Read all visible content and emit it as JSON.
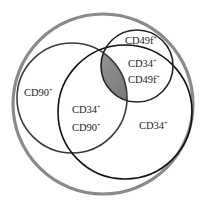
{
  "diagram": {
    "type": "venn",
    "sets": [
      {
        "name": "outer",
        "label": "",
        "color": "#8a8a8a"
      },
      {
        "name": "CD90",
        "label": "CD90",
        "sup": "+",
        "color": "#3a3a3a"
      },
      {
        "name": "CD34",
        "label": "CD34",
        "sup": "+",
        "color": "#111111"
      },
      {
        "name": "CD49f",
        "label": "CD49f",
        "sup": "+",
        "color": "#222222"
      }
    ],
    "labels": {
      "cd49f": {
        "text": "CD49f",
        "sup": "+"
      },
      "cd34_cd49f_1": {
        "text": "CD34",
        "sup": "+"
      },
      "cd34_cd49f_2": {
        "text": "CD49f",
        "sup": "+"
      },
      "cd90": {
        "text": "CD90",
        "sup": "+"
      },
      "cd34_cd90_1": {
        "text": "CD34",
        "sup": "+"
      },
      "cd34_cd90_2": {
        "text": "CD90",
        "sup": "+"
      },
      "cd34": {
        "text": "CD34",
        "sup": "+"
      }
    },
    "highlight": {
      "region": "CD34+ CD90+ CD49f+",
      "color": "#7a7a7a"
    }
  }
}
